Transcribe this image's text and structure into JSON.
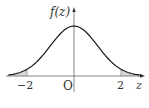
{
  "chart_data": {
    "type": "line",
    "title": "",
    "function_label": "f(z)",
    "xlabel": "z",
    "ylabel": "f(z)",
    "origin_label": "O",
    "x_ticks": [
      {
        "value": -2,
        "label": "−2"
      },
      {
        "value": 2,
        "label": "2"
      }
    ],
    "xlim": [
      -2.8,
      2.9
    ],
    "shaded_regions": [
      {
        "from": "-inf",
        "to": -2
      },
      {
        "from": 2,
        "to": "inf"
      }
    ],
    "series": [
      {
        "name": "f(z)",
        "x": [
          -2.8,
          -2.5,
          -2,
          -1.5,
          -1,
          -0.5,
          0,
          0.5,
          1,
          1.5,
          2,
          2.5,
          2.8
        ],
        "y": [
          0.0079,
          0.0175,
          0.054,
          0.1295,
          0.242,
          0.3521,
          0.3989,
          0.3521,
          0.242,
          0.1295,
          0.054,
          0.0175,
          0.0079
        ]
      }
    ],
    "grid": false,
    "legend": null
  },
  "colors": {
    "curve": "#1a1a1a",
    "axis": "#555555",
    "shade": "#d8d8d8",
    "text": "#333333"
  }
}
